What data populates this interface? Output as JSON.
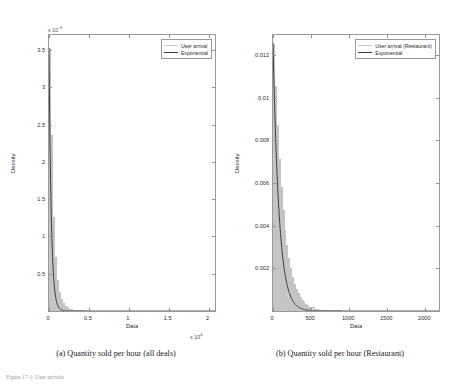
{
  "figure": {
    "caption": "Figure 17-1: User arrivals",
    "subcaptions": {
      "a": "(a) Quantity sold per hour (all deals)",
      "b": "(b) Quantity sold per hour (Restaurant)"
    }
  },
  "colors": {
    "histogram": "#e2e2e2",
    "histogram_edge": "#c4c4c4",
    "fit_curve": "#3d3d3d",
    "axis": "#9a9a9a",
    "text": "#2e2e2e"
  },
  "chart_data": [
    {
      "type": "area",
      "panel": "a",
      "title": "",
      "xlabel": "Data",
      "ylabel": "Density",
      "x_multiplier": "x 10",
      "x_multiplier_exp": "4",
      "y_multiplier": "x 10",
      "y_multiplier_exp": "-3",
      "xlim": [
        0,
        20800
      ],
      "ylim": [
        0,
        0.0037
      ],
      "xticks": [
        0,
        0.5,
        1,
        1.5,
        2
      ],
      "xtick_labels": [
        "0",
        "0.5",
        "1",
        "1.5",
        "2"
      ],
      "xtick_values": [
        0,
        5000,
        10000,
        15000,
        20000
      ],
      "yticks": [
        0.0005,
        0.001,
        0.0015,
        0.002,
        0.0025,
        0.003,
        0.0035
      ],
      "ytick_labels": [
        "0.5",
        "1",
        "1.5",
        "2",
        "2.5",
        "3",
        "3.5"
      ],
      "grid": false,
      "legend_position": "top-right",
      "series": [
        {
          "name": "User arrival",
          "kind": "histogram",
          "bin_width": 250,
          "bin_starts": [
            0,
            250,
            500,
            750,
            1000,
            1250,
            1500,
            1750,
            2000,
            2250,
            2500,
            2750,
            3000,
            3250,
            3500,
            3750,
            4000,
            4500,
            5000,
            5500,
            6000,
            7000,
            8000,
            9000,
            10000,
            12000,
            14000,
            16000,
            18000,
            20000
          ],
          "densities": [
            0.00352,
            0.00236,
            0.00126,
            0.00072,
            0.00042,
            0.00026,
            0.000165,
            0.000108,
            7.2e-05,
            4.9e-05,
            3.35e-05,
            2.32e-05,
            1.62e-05,
            1.14e-05,
            8e-06,
            5.7e-06,
            3.6e-06,
            1.9e-06,
            1e-06,
            5.5e-07,
            3e-07,
            1.2e-07,
            6e-08,
            3e-08,
            2e-08,
            1e-08,
            6e-09,
            4e-09,
            2e-09,
            1e-09
          ]
        },
        {
          "name": "Exponential",
          "kind": "fit",
          "distribution": "exponential",
          "rate_lambda": 0.00352,
          "mean": 284,
          "peak_density": 0.00352
        }
      ]
    },
    {
      "type": "area",
      "panel": "b",
      "title": "",
      "xlabel": "Data",
      "ylabel": "Density",
      "x_multiplier": "",
      "x_multiplier_exp": "",
      "y_multiplier": "",
      "y_multiplier_exp": "",
      "xlim": [
        0,
        2180
      ],
      "ylim": [
        0,
        0.01295
      ],
      "xticks": [
        0,
        500,
        1000,
        1500,
        2000
      ],
      "xtick_labels": [
        "0",
        "500",
        "1000",
        "1500",
        "2000"
      ],
      "yticks": [
        0.002,
        0.004,
        0.006,
        0.008,
        0.01,
        0.012
      ],
      "ytick_labels": [
        "0.002",
        "0.004",
        "0.006",
        "0.008",
        "0.01",
        "0.012"
      ],
      "grid": false,
      "legend_position": "top-right",
      "series": [
        {
          "name": "User arrival (Restaurant)",
          "kind": "histogram",
          "bin_width": 25,
          "bin_starts": [
            0,
            25,
            50,
            75,
            100,
            125,
            150,
            175,
            200,
            225,
            250,
            275,
            300,
            325,
            350,
            375,
            400,
            425,
            450,
            475,
            500,
            550,
            600,
            650,
            700,
            800,
            900,
            1000,
            1200,
            1400,
            1600,
            1800,
            2000
          ],
          "densities": [
            0.01255,
            0.01058,
            0.00872,
            0.00712,
            0.00582,
            0.00472,
            0.00382,
            0.00308,
            0.00248,
            0.002,
            0.00161,
            0.00129,
            0.00104,
            0.00083,
            0.00066,
            0.00053,
            0.00042,
            0.00034,
            0.00027,
            0.00021,
            0.00017,
            0.00011,
            7e-05,
            4.5e-05,
            3e-05,
            1.2e-05,
            5e-06,
            2e-06,
            5e-07,
            2e-07,
            1e-07,
            5e-08,
            2e-08
          ]
        },
        {
          "name": "Exponential",
          "kind": "fit",
          "distribution": "exponential",
          "rate_lambda": 0.0126,
          "mean": 79.4,
          "peak_density": 0.0126
        }
      ]
    }
  ]
}
